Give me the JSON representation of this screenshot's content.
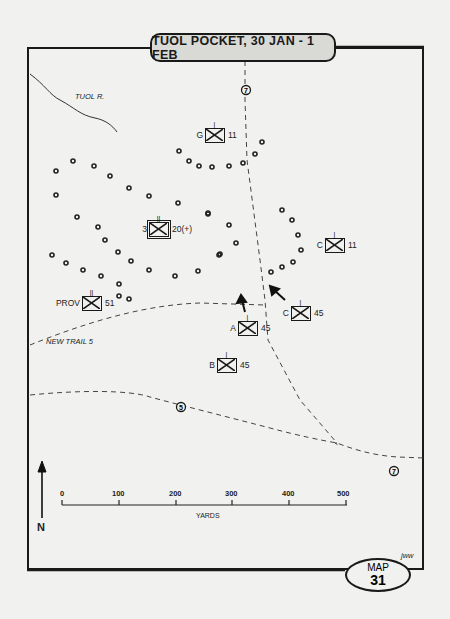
{
  "title": "TUOL POCKET, 30 JAN - 1 FEB",
  "map_badge": {
    "label": "MAP",
    "number": "31"
  },
  "signature": "jww",
  "river": {
    "label": "TUOL R."
  },
  "trail_label": "NEW TRAIL 5",
  "route_markers": [
    {
      "id": "route-7-north",
      "label": "7"
    },
    {
      "id": "route-5",
      "label": "5"
    },
    {
      "id": "route-7-east",
      "label": "7"
    }
  ],
  "units": [
    {
      "id": "unit-g-11",
      "left": "G",
      "right": "11"
    },
    {
      "id": "unit-3-20",
      "left": "3",
      "right": "20(+)"
    },
    {
      "id": "unit-c-11",
      "left": "C",
      "right": "11"
    },
    {
      "id": "unit-prov-51",
      "left": "PROV",
      "right": "51"
    },
    {
      "id": "unit-c-45",
      "left": "C",
      "right": "45"
    },
    {
      "id": "unit-a-45",
      "left": "A",
      "right": "45"
    },
    {
      "id": "unit-b-45",
      "left": "B",
      "right": "45"
    }
  ],
  "scale": {
    "ticks": [
      "0",
      "100",
      "200",
      "300",
      "400",
      "500"
    ],
    "unit": "YARDS"
  },
  "north_label": "N",
  "colors": {
    "ink": "#1a1a1a",
    "paper": "#f1f1ef",
    "title_fill": "#d9d9d6"
  }
}
